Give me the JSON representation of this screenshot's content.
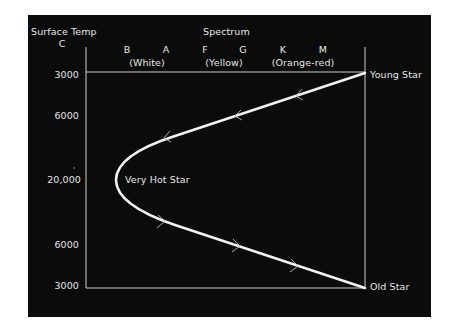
{
  "diagram": {
    "y_axis_title": "Surface Temp",
    "y_axis_unit": "C",
    "x_axis_title": "Spectrum",
    "spectral_classes": [
      "B",
      "A",
      "F",
      "G",
      "K",
      "M"
    ],
    "color_groups": [
      "(White)",
      "(Yellow)",
      "(Orange-red)"
    ],
    "y_ticks": [
      "3000",
      "6000",
      "20,000",
      "6000",
      "3000"
    ],
    "annotations": {
      "young_star": "Young Star",
      "very_hot_star": "Very Hot Star",
      "old_star": "Old Star"
    },
    "colors": {
      "background": "#0b0b0b",
      "line": "#f2f2f2",
      "text": "#e6e6e6"
    }
  }
}
